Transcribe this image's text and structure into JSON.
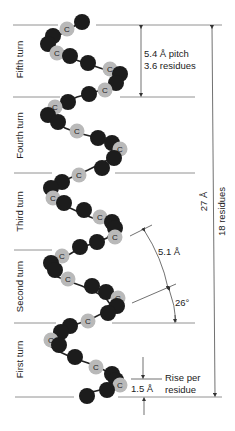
{
  "turns": [
    {
      "label": "Fifth turn"
    },
    {
      "label": "Fourth turn"
    },
    {
      "label": "Third turn"
    },
    {
      "label": "Second turn"
    },
    {
      "label": "First turn"
    }
  ],
  "annotations": {
    "pitch_line1": "5.4 Å pitch",
    "pitch_line2": "3.6 residues",
    "total_length": "27 Å",
    "total_residues": "18 residues",
    "distance": "5.1 Å",
    "angle": "26°",
    "rise_value": "1.5 Å",
    "rise_line1": "Rise per",
    "rise_line2": "residue"
  },
  "atom_label": "C",
  "colors": {
    "dark_atom": "#1c1c1c",
    "light_atom": "#b9b9b9",
    "line": "#555555"
  }
}
